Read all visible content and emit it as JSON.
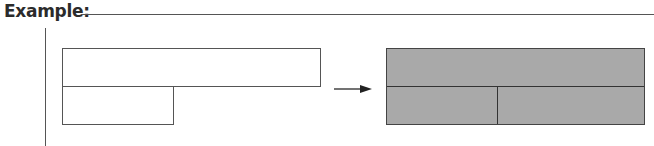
{
  "header": {
    "title": "Example:"
  },
  "diagram": {
    "before": {
      "shapes": [
        {
          "name": "top-rectangle",
          "fill": "#ffffff"
        },
        {
          "name": "bottom-rectangle",
          "fill": "#ffffff"
        }
      ]
    },
    "arrow": {
      "direction": "right"
    },
    "after": {
      "fill": "#a9a9a9",
      "rows": 2,
      "bottom_row_cells": 2
    }
  }
}
